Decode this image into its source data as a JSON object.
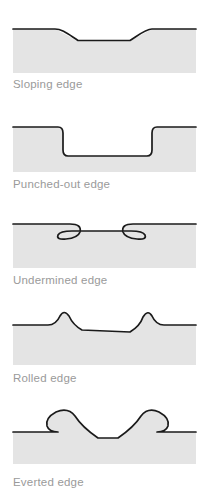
{
  "figure": {
    "width": 203,
    "height": 504,
    "background_color": "#ffffff",
    "tissue_fill_color": "#e4e4e4",
    "profile_line_color": "#1a1a1a",
    "caption_color": "#9a9a9a",
    "panel_left": 13,
    "panel_right": 196
  },
  "panels": [
    {
      "id": "sloping-edge",
      "caption": "Sloping edge",
      "description": "Shallow wound with gently sloping sides and a broad flat base",
      "panel_top": 22,
      "panel_bottom": 73,
      "caption_y": 83,
      "surface_y": 29,
      "floor_y": 41,
      "left_slope_start_x": 55,
      "left_slope_end_x": 78,
      "right_slope_start_x": 130,
      "right_slope_end_x": 152
    },
    {
      "id": "punched-out-edge",
      "caption": "Punched-out edge",
      "description": "Deep wound with steep vertical walls and a flat base",
      "panel_top": 120,
      "panel_bottom": 172,
      "caption_y": 181,
      "surface_y": 127,
      "floor_y": 156,
      "left_wall_x": 62,
      "right_wall_x": 152
    },
    {
      "id": "undermined-edge",
      "caption": "Undermined edge",
      "description": "Wound with overhanging lips where tissue is eroded beneath the surface margins",
      "panel_top": 216,
      "panel_bottom": 268,
      "caption_y": 277,
      "surface_y": 224,
      "floor_y": 240,
      "left_lip_x": 74,
      "right_lip_x": 139
    },
    {
      "id": "rolled-edge",
      "caption": "Rolled edge",
      "description": "Shallow depression flanked by two raised rounded bumps of heaped tissue",
      "panel_top": 313,
      "panel_bottom": 365,
      "caption_y": 378,
      "surface_y": 325,
      "floor_y": 333,
      "left_bump_x": 59,
      "right_bump_x": 151,
      "bump_peak_y": 314
    },
    {
      "id": "everted-edge",
      "caption": "Everted edge",
      "description": "Wound with tall lips curled upward and outward over the surrounding surface",
      "panel_top": 404,
      "panel_bottom": 464,
      "caption_y": 482,
      "surface_y": 432,
      "floor_y": 440,
      "left_lip_x": 57,
      "right_lip_x": 152,
      "lip_peak_y": 408
    }
  ]
}
